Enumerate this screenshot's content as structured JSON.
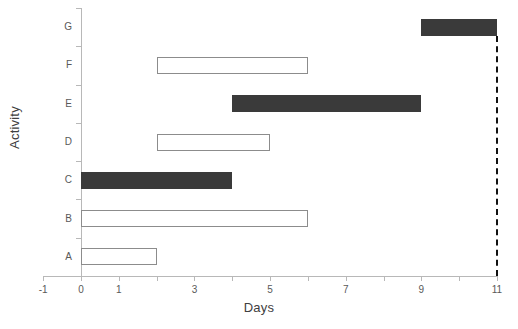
{
  "chart_data": {
    "type": "bar",
    "chart_style": "gantt",
    "title": "",
    "xlabel": "Days",
    "ylabel": "Activity",
    "xlim": [
      -1,
      11
    ],
    "ylim_categories": [
      "A",
      "B",
      "C",
      "D",
      "E",
      "F",
      "G"
    ],
    "x_tick_values": [
      -1,
      0,
      1,
      2,
      3,
      4,
      5,
      6,
      7,
      8,
      9,
      10,
      11
    ],
    "x_tick_labels": [
      "-1",
      "0",
      "1",
      "",
      "3",
      "",
      "5",
      "",
      "7",
      "",
      "9",
      "",
      "11"
    ],
    "x_labeled_ticks": [
      {
        "value": -1,
        "label": "-1"
      },
      {
        "value": 0,
        "label": "0"
      },
      {
        "value": 1,
        "label": "1"
      },
      {
        "value": 3,
        "label": "3"
      },
      {
        "value": 5,
        "label": "5"
      },
      {
        "value": 7,
        "label": "7"
      },
      {
        "value": 9,
        "label": "9"
      },
      {
        "value": 11,
        "label": "11"
      }
    ],
    "y_categories_top_to_bottom": [
      "G",
      "F",
      "E",
      "D",
      "C",
      "B",
      "A"
    ],
    "grid": false,
    "legend": "none",
    "bars": [
      {
        "activity": "G",
        "start": 9,
        "end": 11,
        "duration": 2,
        "critical": true,
        "fill": "#3a3a3a"
      },
      {
        "activity": "F",
        "start": 2,
        "end": 6,
        "duration": 4,
        "critical": false,
        "fill": "#ffffff"
      },
      {
        "activity": "E",
        "start": 4,
        "end": 9,
        "duration": 5,
        "critical": true,
        "fill": "#3a3a3a"
      },
      {
        "activity": "D",
        "start": 2,
        "end": 5,
        "duration": 3,
        "critical": false,
        "fill": "#ffffff"
      },
      {
        "activity": "C",
        "start": 0,
        "end": 4,
        "duration": 4,
        "critical": true,
        "fill": "#3a3a3a"
      },
      {
        "activity": "B",
        "start": 0,
        "end": 6,
        "duration": 6,
        "critical": false,
        "fill": "#ffffff"
      },
      {
        "activity": "A",
        "start": 0,
        "end": 2,
        "duration": 2,
        "critical": false,
        "fill": "#ffffff"
      }
    ],
    "annotations": [
      {
        "name": "completion-line",
        "type": "vertical-dashed-line",
        "x": 11
      }
    ],
    "colors": {
      "critical_fill": "#3a3a3a",
      "normal_fill": "#ffffff",
      "normal_border": "#8c8c8c",
      "axis": "#b8b8b8",
      "text": "#595959",
      "title_text": "#404040",
      "completion_line": "#111111"
    }
  }
}
